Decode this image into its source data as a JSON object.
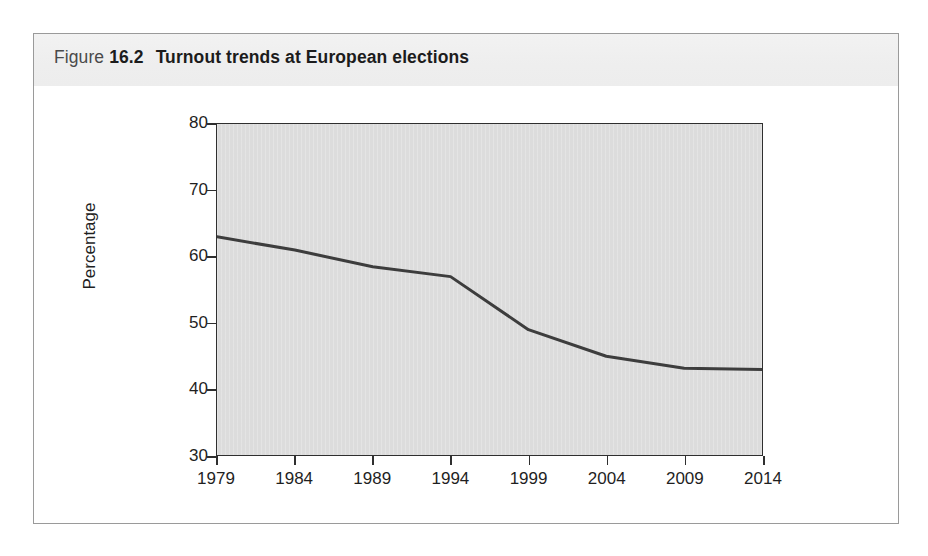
{
  "figure": {
    "caption_label": "Figure",
    "caption_number": "16.2",
    "caption_title": "Turnout trends at European elections"
  },
  "chart_data": {
    "type": "line",
    "title": "Turnout trends at European elections",
    "xlabel": "",
    "ylabel": "Percentage",
    "categories": [
      "1979",
      "1984",
      "1989",
      "1994",
      "1999",
      "2004",
      "2009",
      "2014"
    ],
    "values": [
      63.0,
      61.0,
      58.5,
      57.0,
      49.0,
      45.0,
      43.2,
      43.0
    ],
    "series": [
      {
        "name": "Turnout",
        "values": [
          63.0,
          61.0,
          58.5,
          57.0,
          49.0,
          45.0,
          43.2,
          43.0
        ],
        "color": "#3d3d3d"
      }
    ],
    "ylim": [
      30,
      80
    ],
    "y_ticks": [
      "80",
      "70",
      "60",
      "50",
      "40",
      "30"
    ],
    "y_tick_values": [
      80,
      70,
      60,
      50,
      40,
      30
    ],
    "x_ticks": [
      "1979",
      "1984",
      "1989",
      "1994",
      "1999",
      "2004",
      "2009",
      "2014"
    ],
    "grid": false,
    "legend": "none",
    "plot_background": "#dcdcdc",
    "axis_color": "#2f2f2f",
    "line_color": "#3d3d3d",
    "line_width": 3
  }
}
